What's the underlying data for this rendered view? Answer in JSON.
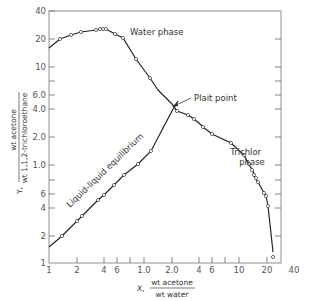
{
  "chart_data": {
    "type": "line",
    "title": "",
    "xlabel": "X, wt acetone / wt water",
    "ylabel": "Y, wt acetone / wt 1,1,2-trichloroethane",
    "x_axis": {
      "prefix": "X,",
      "numerator": "wt acetone",
      "denominator": "wt water",
      "scale": "log",
      "tick_labels": [
        "1",
        "2",
        "4",
        "6",
        "1.0",
        "2.0",
        "4",
        "6",
        "10",
        "20",
        "40"
      ]
    },
    "y_axis": {
      "prefix": "Y,",
      "numerator": "wt acetone",
      "denominator": "wt 1,1,2-trichloroethane",
      "scale": "log",
      "tick_labels": [
        "40",
        "20",
        "10",
        "6.0",
        "4.0",
        "2.0",
        "1.0",
        "6",
        "4",
        "2",
        "1"
      ]
    },
    "grid": false,
    "annotations": [
      "Water phase",
      "Plait point",
      "Trichlor phase",
      "Liquid-liquid equilibrium"
    ],
    "series": [
      {
        "name": "Water phase",
        "points_px": [
          [
            49,
            48
          ],
          [
            60,
            39
          ],
          [
            71,
            35
          ],
          [
            81,
            32
          ],
          [
            96,
            30
          ],
          [
            100,
            29
          ],
          [
            103,
            29
          ],
          [
            106,
            29
          ],
          [
            115,
            34
          ],
          [
            123,
            38
          ],
          [
            136,
            59
          ],
          [
            150,
            78
          ],
          [
            158,
            90
          ]
        ],
        "marker": "circle"
      },
      {
        "name": "Trichlor phase",
        "points_px": [
          [
            158,
            90
          ],
          [
            172,
            104
          ],
          [
            177,
            111
          ],
          [
            188,
            115
          ],
          [
            194,
            119
          ],
          [
            200,
            124
          ],
          [
            203,
            127
          ],
          [
            212,
            134
          ],
          [
            231,
            143
          ],
          [
            244,
            155
          ],
          [
            248,
            163
          ],
          [
            253,
            171
          ],
          [
            253,
            175
          ],
          [
            255,
            178
          ],
          [
            257,
            182
          ],
          [
            258,
            182
          ],
          [
            264,
            193
          ],
          [
            266,
            196
          ],
          [
            268,
            206
          ],
          [
            273,
            252
          ]
        ],
        "marker": "circle"
      },
      {
        "name": "Liquid-liquid equilibrium",
        "points_px": [
          [
            49,
            247
          ],
          [
            62,
            236
          ],
          [
            77,
            221
          ],
          [
            82,
            216
          ],
          [
            98,
            200
          ],
          [
            104,
            195
          ],
          [
            114,
            185
          ],
          [
            124,
            175
          ],
          [
            138,
            164
          ],
          [
            151,
            151
          ],
          [
            172,
            111
          ]
        ],
        "marker": "circle"
      }
    ],
    "plait_point_px": [
      172,
      106
    ]
  }
}
